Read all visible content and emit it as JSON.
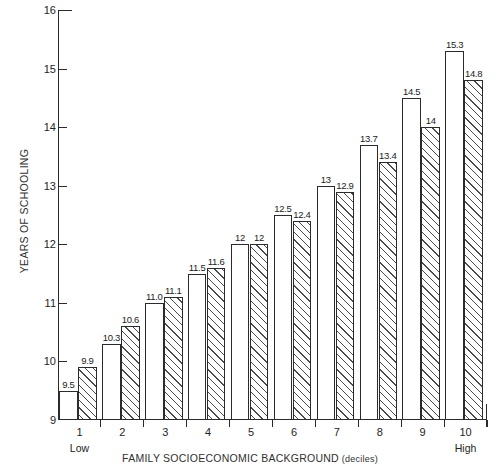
{
  "chart_data": {
    "type": "bar",
    "title": "",
    "xlabel": "FAMILY SOCIOECONOMIC BACKGROUND (deciles)",
    "xlabel_main": "FAMILY SOCIOECONOMIC BACKGROUND",
    "xlabel_suffix": "(deciles)",
    "ylabel": "YEARS OF SCHOOLING",
    "ylim": [
      9,
      16
    ],
    "yticks": [
      9,
      10,
      11,
      12,
      13,
      14,
      15,
      16
    ],
    "ytick_labels": [
      "9",
      "10",
      "11",
      "12",
      "13",
      "14",
      "15",
      "16"
    ],
    "categories": [
      "1",
      "2",
      "3",
      "4",
      "5",
      "6",
      "7",
      "8",
      "9",
      "10"
    ],
    "x_low_label": "Low",
    "x_high_label": "High",
    "grid": false,
    "legend": "none",
    "series": [
      {
        "name": "first-bar",
        "style": "open",
        "values": [
          9.5,
          10.3,
          11.0,
          11.5,
          12.0,
          12.5,
          13.0,
          13.7,
          14.5,
          15.3
        ],
        "labels": [
          "9.5",
          "10.3",
          "11.0",
          "11.5",
          "12",
          "12.5",
          "13",
          "13.7",
          "14.5",
          "15.3"
        ]
      },
      {
        "name": "second-bar",
        "style": "hatched",
        "values": [
          9.9,
          10.6,
          11.1,
          11.6,
          12.0,
          12.4,
          12.9,
          13.4,
          14.0,
          14.8
        ],
        "labels": [
          "9.9",
          "10.6",
          "11.1",
          "11.6",
          "12",
          "12.4",
          "12.9",
          "13.4",
          "14",
          "14.8"
        ]
      }
    ]
  }
}
